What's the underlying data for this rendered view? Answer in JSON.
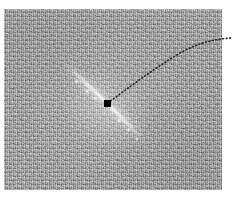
{
  "figure": {
    "type": "astronomical-image",
    "canvas": {
      "width": 233,
      "height": 197,
      "background": "#ffffff"
    }
  },
  "image_panel": {
    "name": "grayscale-image-panel",
    "bounds": {
      "x": 4,
      "y": 9,
      "width": 218,
      "height": 181
    },
    "background_color": "#a0a0a0",
    "noise": "fine-grained pixel noise",
    "colormap": "grayscale"
  },
  "features": {
    "jet": {
      "label": "bright-linear-streak",
      "color": "#ffffff",
      "upper_left_end": {
        "x": 66,
        "y": 66
      },
      "lower_right_end": {
        "x": 146,
        "y": 143
      },
      "position_angle_deg": 45,
      "knots": [
        {
          "x": 78,
          "y": 78,
          "size": 4
        },
        {
          "x": 88,
          "y": 88,
          "size": 5
        },
        {
          "x": 96,
          "y": 95,
          "size": 4
        },
        {
          "x": 117,
          "y": 114,
          "size": 5
        },
        {
          "x": 127,
          "y": 124,
          "size": 4
        },
        {
          "x": 137,
          "y": 134,
          "size": 3
        }
      ]
    },
    "source_marker": {
      "label": "source-position-marker",
      "shape": "filled-square",
      "color": "#000000",
      "x": 107,
      "y": 103,
      "size": 7
    },
    "trajectory": {
      "label": "dotted-model-curve",
      "style": "dotted",
      "color": "#262626",
      "points": [
        {
          "x": 108,
          "y": 103
        },
        {
          "x": 124,
          "y": 89
        },
        {
          "x": 142,
          "y": 75
        },
        {
          "x": 162,
          "y": 62
        },
        {
          "x": 184,
          "y": 51
        },
        {
          "x": 205,
          "y": 44
        },
        {
          "x": 222,
          "y": 40
        },
        {
          "x": 231,
          "y": 39
        }
      ]
    }
  }
}
